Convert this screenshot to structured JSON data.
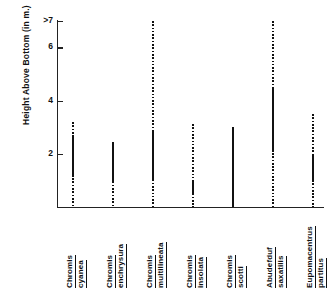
{
  "chart_data": {
    "type": "bar",
    "title": "",
    "subtitle": "",
    "xlabel": "",
    "ylabel": "Height Above Bottom (in m.)",
    "ylim": [
      0,
      7
    ],
    "ytick_labels": [
      ">7",
      "6",
      "4",
      "2"
    ],
    "ytick_values": [
      7,
      6,
      4,
      2
    ],
    "grid": false,
    "legend": null,
    "categories": [
      "Chromis cyanea",
      "Chromis enchrysura",
      "Chromis multilineata",
      "Chromis insolata",
      "Chromis scotti",
      "Abudefduf saxatilis",
      "Eupomacentrus partitus"
    ],
    "category_lines": [
      [
        "Chromis",
        "cyanea"
      ],
      [
        "Chromis",
        "enchrysura"
      ],
      [
        "Chromis",
        "multilineata"
      ],
      [
        "Chromis",
        "insolata"
      ],
      [
        "Chromis",
        "scotti"
      ],
      [
        "Abudefduf",
        "saxatilis"
      ],
      [
        "Eupomacentrus",
        "partitus"
      ]
    ],
    "series": [
      {
        "name": "dotted_range_min",
        "values": [
          0.0,
          0.0,
          0.0,
          0.0,
          0.0,
          0.0,
          0.0
        ]
      },
      {
        "name": "dotted_range_max",
        "values": [
          3.2,
          2.45,
          7.0,
          3.1,
          3.0,
          7.0,
          3.5
        ]
      },
      {
        "name": "solid_range_min",
        "values": [
          1.1,
          0.9,
          0.95,
          0.45,
          0.0,
          2.05,
          1.0
        ]
      },
      {
        "name": "solid_range_max",
        "values": [
          2.7,
          2.45,
          2.8,
          1.0,
          3.0,
          4.45,
          1.95
        ]
      }
    ],
    "bars": [
      {
        "category": "Chromis cyanea",
        "dotted_min": 0.0,
        "dotted_max": 3.2,
        "solid_min": 1.1,
        "solid_max": 2.7,
        "open_top": false
      },
      {
        "category": "Chromis enchrysura",
        "dotted_min": 0.0,
        "dotted_max": 2.45,
        "solid_min": 0.9,
        "solid_max": 2.45,
        "open_top": false
      },
      {
        "category": "Chromis multilineata",
        "dotted_min": 0.0,
        "dotted_max": 7.0,
        "solid_min": 0.95,
        "solid_max": 2.8,
        "open_top": true
      },
      {
        "category": "Chromis insolata",
        "dotted_min": 0.0,
        "dotted_max": 3.1,
        "solid_min": 0.45,
        "solid_max": 1.0,
        "open_top": false
      },
      {
        "category": "Chromis scotti",
        "dotted_min": 0.0,
        "dotted_max": 0.0,
        "solid_min": 0.0,
        "solid_max": 3.0,
        "open_top": false
      },
      {
        "category": "Abudefduf saxatilis",
        "dotted_min": 0.0,
        "dotted_max": 7.0,
        "solid_min": 2.05,
        "solid_max": 4.45,
        "open_top": true
      },
      {
        "category": "Eupomacentrus partitus",
        "dotted_min": 0.0,
        "dotted_max": 3.5,
        "solid_min": 1.0,
        "solid_max": 1.95,
        "open_top": false
      }
    ],
    "colors": {
      "axis": "#222222",
      "bar": "#111111",
      "background": "#ffffff"
    }
  }
}
